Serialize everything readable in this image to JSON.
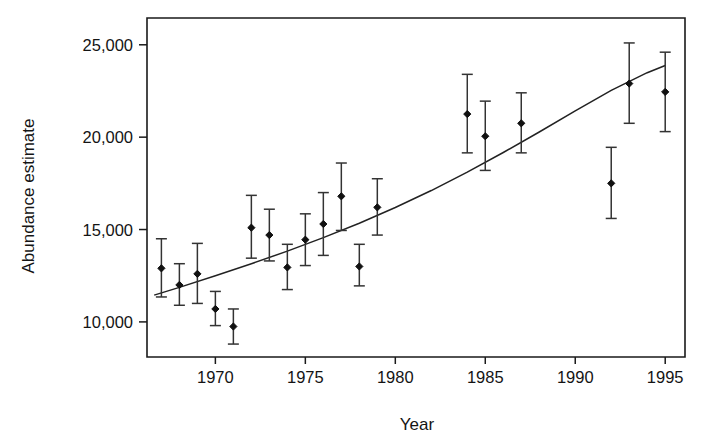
{
  "chart_data": {
    "type": "scatter",
    "title": "",
    "xlabel": "Year",
    "ylabel": "Abundance estimate",
    "xlim": [
      1966.2,
      1996.1
    ],
    "ylim": [
      8100,
      26450
    ],
    "grid": false,
    "legend": null,
    "xticks": [
      1970,
      1975,
      1980,
      1985,
      1990,
      1995
    ],
    "xtick_labels": [
      "1970",
      "1975",
      "1980",
      "1985",
      "1990",
      "1995"
    ],
    "yticks": [
      10000,
      15000,
      20000,
      25000
    ],
    "ytick_labels": [
      "10,000",
      "15,000",
      "20,000",
      "25,000"
    ],
    "marker": "filled-diamond",
    "marker_color": "#111111",
    "errorbar_color": "#333333",
    "trendline_color": "#222222",
    "series": [
      {
        "name": "Abundance estimate",
        "x": [
          1967,
          1968,
          1969,
          1970,
          1971,
          1972,
          1973,
          1974,
          1975,
          1976,
          1977,
          1978,
          1979,
          1984,
          1985,
          1987,
          1992,
          1993,
          1995
        ],
        "values": [
          12900,
          12000,
          12600,
          10700,
          9750,
          15100,
          14700,
          12950,
          14450,
          15300,
          16800,
          13000,
          16200,
          21250,
          20050,
          20750,
          17500,
          22900,
          22450
        ],
        "err_low": [
          11350,
          10900,
          11000,
          9800,
          8800,
          13450,
          13300,
          11750,
          13050,
          13600,
          14950,
          11950,
          14700,
          19150,
          18200,
          19150,
          15600,
          20750,
          20300
        ],
        "err_high": [
          14500,
          13150,
          14250,
          11650,
          10700,
          16850,
          16100,
          14200,
          15850,
          17000,
          18600,
          14200,
          17750,
          23400,
          21950,
          22400,
          19450,
          25100,
          24600
        ]
      }
    ],
    "trendline": {
      "name": "fitted curve",
      "x": [
        1966.6,
        1968,
        1970,
        1972,
        1974,
        1976,
        1978,
        1980,
        1982,
        1984,
        1986,
        1988,
        1990,
        1992,
        1994,
        1995
      ],
      "values": [
        11450,
        11870,
        12500,
        13150,
        13830,
        14560,
        15340,
        16190,
        17110,
        18110,
        19170,
        20280,
        21420,
        22530,
        23490,
        23880
      ]
    }
  },
  "axes": {
    "x_label": "Year",
    "y_label": "Abundance estimate"
  }
}
